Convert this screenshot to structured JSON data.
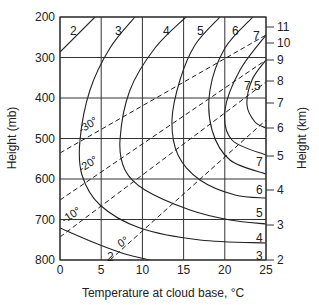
{
  "chart_data": {
    "type": "line",
    "title": "",
    "xlabel": "Temperature at cloud base, °C",
    "ylabel_left": "Height (mb)",
    "ylabel_right": "Height (km)",
    "xlim": [
      0,
      25
    ],
    "ylim_mb": [
      800,
      200
    ],
    "x_ticks": [
      0,
      5,
      10,
      15,
      20,
      25
    ],
    "y_ticks_mb": [
      200,
      300,
      400,
      500,
      600,
      700,
      800
    ],
    "y_ticks_km": [
      {
        "label": "2",
        "y": 260
      },
      {
        "label": "3",
        "y": 225
      },
      {
        "label": "4",
        "y": 190
      },
      {
        "label": "5",
        "y": 156
      },
      {
        "label": "6",
        "y": 128
      },
      {
        "label": "7",
        "y": 103
      },
      {
        "label": "8",
        "y": 81
      },
      {
        "label": "9",
        "y": 60
      },
      {
        "label": "10",
        "y": 43
      },
      {
        "label": "11",
        "y": 27
      }
    ],
    "grid": true,
    "solid_curves": [
      {
        "label": "2",
        "paths": [
          [
            [
              60,
              52
            ],
            [
              95,
              17
            ]
          ],
          [
            [
              60,
              228
            ],
            [
              95,
              243
            ],
            [
              125,
              254
            ],
            [
              150,
              260
            ]
          ]
        ],
        "label_pos": [
          [
            70,
            31
          ],
          [
            107,
            257
          ]
        ]
      },
      {
        "label": "3",
        "paths": [
          [
            [
              135,
              17
            ],
            [
              110,
              48
            ],
            [
              90,
              90
            ],
            [
              80,
              140
            ],
            [
              82,
              175
            ],
            [
              100,
              205
            ],
            [
              140,
              228
            ],
            [
              200,
              240
            ],
            [
              266,
              243
            ]
          ]
        ],
        "label_pos": [
          [
            115,
            31
          ],
          [
            256,
            256
          ]
        ]
      },
      {
        "label": "4",
        "paths": [
          [
            [
              186,
              17
            ],
            [
              155,
              48
            ],
            [
              130,
              90
            ],
            [
              120,
              140
            ],
            [
              125,
              170
            ],
            [
              145,
              190
            ],
            [
              190,
              210
            ],
            [
              230,
              220
            ],
            [
              266,
              224
            ]
          ]
        ],
        "label_pos": [
          [
            163,
            31
          ],
          [
            256,
            238
          ]
        ]
      },
      {
        "label": "5",
        "paths": [
          [
            [
              220,
              17
            ],
            [
              195,
              45
            ],
            [
              180,
              80
            ],
            [
              172,
              120
            ],
            [
              178,
              155
            ],
            [
              200,
              180
            ],
            [
              235,
              195
            ],
            [
              266,
              198
            ]
          ]
        ],
        "label_pos": [
          [
            197,
            31
          ],
          [
            256,
            213
          ]
        ]
      },
      {
        "label": "6",
        "paths": [
          [
            [
              253,
              17
            ],
            [
              225,
              48
            ],
            [
              210,
              90
            ],
            [
              212,
              130
            ],
            [
              230,
              160
            ],
            [
              266,
              174
            ]
          ]
        ],
        "label_pos": [
          [
            232,
            31
          ],
          [
            256,
            190
          ]
        ]
      },
      {
        "label": "7",
        "paths": [
          [
            [
              266,
              35
            ],
            [
              240,
              70
            ],
            [
              225,
              110
            ],
            [
              232,
              140
            ],
            [
              266,
              155
            ]
          ]
        ],
        "label_pos": [
          [
            253,
            36
          ],
          [
            256,
            162
          ]
        ]
      },
      {
        "label": "7.5",
        "paths": [
          [
            [
              266,
              60
            ],
            [
              252,
              80
            ],
            [
              247,
              105
            ],
            [
              255,
              122
            ],
            [
              266,
              128
            ]
          ]
        ],
        "label_pos": [
          [
            244,
            86
          ]
        ]
      }
    ],
    "dashed_isotherms": [
      {
        "label": "-30°",
        "paths": [
          [
            [
              60,
              153
            ],
            [
              266,
              35
            ]
          ]
        ],
        "label_pos": [
          90,
          128
        ]
      },
      {
        "label": "-20°",
        "paths": [
          [
            [
              60,
              200
            ],
            [
              266,
              60
            ]
          ]
        ],
        "label_pos": [
          90,
          167
        ]
      },
      {
        "label": "-10°",
        "paths": [
          [
            [
              60,
              237
            ],
            [
              266,
              82
            ]
          ]
        ],
        "label_pos": [
          73,
          218
        ]
      },
      {
        "label": "0°",
        "paths": [
          [
            [
              110,
              260
            ],
            [
              266,
              120
            ]
          ]
        ],
        "label_pos": [
          125,
          245
        ]
      }
    ]
  }
}
